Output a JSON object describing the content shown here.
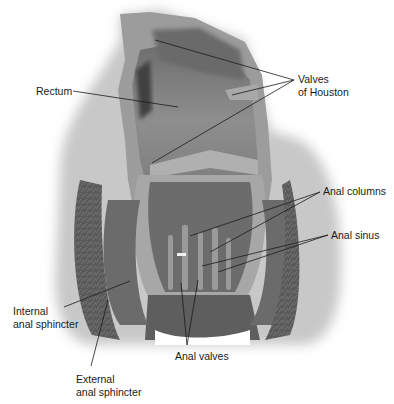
{
  "diagram": {
    "colors": {
      "background": "#ffffff",
      "tissue_light": "#a9a9a9",
      "tissue_mid": "#7d7d7d",
      "tissue_dark": "#4e4e4e",
      "muscle_texture": "#5c5c5c",
      "wall_light": "#b8b8b8",
      "leader_line": "#1a1a1a",
      "label_text": "#1a1a1a"
    },
    "labels": [
      {
        "id": "rectum",
        "lines": [
          "Rectum"
        ]
      },
      {
        "id": "valves-of-houston",
        "lines": [
          "Valves",
          "of Houston"
        ]
      },
      {
        "id": "anal-columns",
        "lines": [
          "Anal columns"
        ]
      },
      {
        "id": "anal-sinus",
        "lines": [
          "Anal sinus"
        ]
      },
      {
        "id": "internal-anal-sphincter",
        "lines": [
          "Internal",
          "anal sphincter"
        ]
      },
      {
        "id": "anal-valves",
        "lines": [
          "Anal valves"
        ]
      },
      {
        "id": "external-anal-sphincter",
        "lines": [
          "External",
          "anal sphincter"
        ]
      }
    ]
  }
}
